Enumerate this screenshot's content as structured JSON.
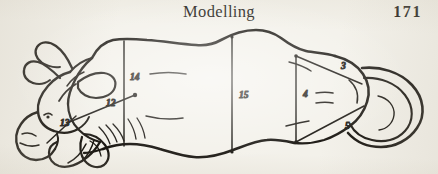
{
  "page": {
    "background_color": "#f3f1ea",
    "ink_color": "#17140f"
  },
  "header": {
    "running_head": "Modelling",
    "folio": "171"
  },
  "figure": {
    "caption": "",
    "measurements": [
      {
        "id": "m3",
        "label": "3",
        "x": 341,
        "y": 47,
        "orientation": "diagonal",
        "region": "hindquarter-upper"
      },
      {
        "id": "m4",
        "label": "4",
        "x": 303,
        "y": 75,
        "orientation": "vertical",
        "region": "hindquarter-height"
      },
      {
        "id": "m5",
        "label": "5",
        "x": 345,
        "y": 107,
        "orientation": "diagonal",
        "region": "hindquarter-lower"
      },
      {
        "id": "m12",
        "label": "12",
        "x": 106,
        "y": 84,
        "orientation": "diagonal",
        "region": "neck-to-shoulder"
      },
      {
        "id": "m13",
        "label": "13",
        "x": 60,
        "y": 104,
        "orientation": "diagonal",
        "region": "head-to-jaw"
      },
      {
        "id": "m14",
        "label": "14",
        "x": 130,
        "y": 58,
        "orientation": "vertical",
        "region": "shoulder-height"
      },
      {
        "id": "m15",
        "label": "15",
        "x": 239,
        "y": 76,
        "orientation": "vertical",
        "region": "barrel-height"
      }
    ]
  }
}
